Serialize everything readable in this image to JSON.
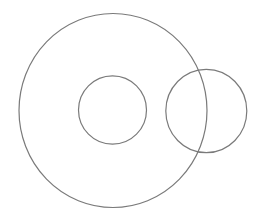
{
  "canvas": {
    "width": 263,
    "height": 218,
    "background": "#ffffff"
  },
  "stroke": {
    "color": "#7a7a7a",
    "width": 1.2
  },
  "shapes": [
    {
      "name": "outer-circle",
      "cx": 113,
      "cy": 110.5,
      "rx": 94,
      "ry": 97
    },
    {
      "name": "inner-circle",
      "cx": 112.5,
      "cy": 110,
      "rx": 34,
      "ry": 34.2
    },
    {
      "name": "right-circle",
      "cx": 206.3,
      "cy": 111,
      "rx": 40.5,
      "ry": 41.7
    }
  ]
}
